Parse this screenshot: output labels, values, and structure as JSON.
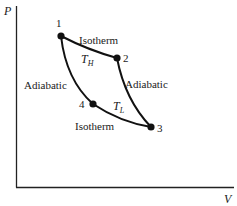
{
  "diagram": {
    "axes": {
      "y_label": "P",
      "x_label": "V"
    },
    "points": [
      {
        "id": "1",
        "label": "1"
      },
      {
        "id": "2",
        "label": "2"
      },
      {
        "id": "3",
        "label": "3"
      },
      {
        "id": "4",
        "label": "4"
      }
    ],
    "curves": {
      "top": "Isotherm",
      "bottom": "Isotherm",
      "left": "Adiabatic",
      "right": "Adiabatic"
    },
    "temperatures": {
      "high_symbol": "T",
      "high_sub": "H",
      "low_symbol": "T",
      "low_sub": "L"
    },
    "colors": {
      "line": "#111111",
      "background": "#ffffff"
    }
  }
}
